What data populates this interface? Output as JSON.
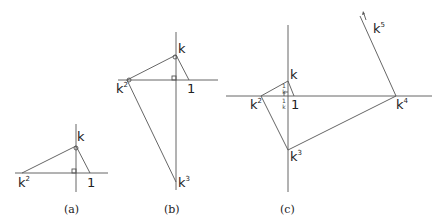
{
  "panels": {
    "a": {
      "caption": "(a)",
      "labels": {
        "k": "k",
        "k2_base": "k",
        "k2_sup": "2",
        "one": "1"
      }
    },
    "b": {
      "caption": "(b)",
      "labels": {
        "k": "k",
        "k2_base": "k",
        "k2_sup": "2",
        "one": "1",
        "k3_base": "k",
        "k3_sup": "3"
      }
    },
    "c": {
      "caption": "(c)",
      "labels": {
        "k": "k",
        "k2_base": "k",
        "k2_sup": "2",
        "one": "1",
        "k3_base": "k",
        "k3_sup": "3",
        "k4_base": "k",
        "k4_sup": "4",
        "k5_base": "k",
        "k5_sup": "5",
        "inv_k_top_num": "1",
        "inv_k_top_den": "k",
        "inv_k_bot_num": "1",
        "inv_k_bot_den": "k"
      }
    }
  },
  "colors": {
    "line": "#555555",
    "text": "#222222"
  }
}
